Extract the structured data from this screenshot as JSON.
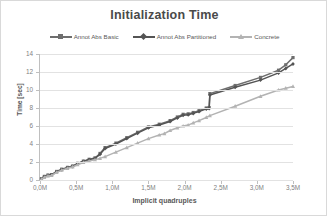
{
  "chart_data": {
    "type": "line",
    "title": "Initialization Time",
    "xlabel": "Implicit quadruples",
    "ylabel": "Time [sec]",
    "xlim": [
      0,
      3500000
    ],
    "ylim": [
      0,
      14
    ],
    "grid": true,
    "legend_position": "top",
    "x_tick_labels": [
      "0,0M",
      "0,5M",
      "1,0M",
      "1,5M",
      "2,0M",
      "2,5M",
      "3,0M",
      "3,5M"
    ],
    "x_tick_values": [
      0,
      500000,
      1000000,
      1500000,
      2000000,
      2500000,
      3000000,
      3500000
    ],
    "y_tick_labels": [
      "0",
      "2",
      "4",
      "6",
      "8",
      "10",
      "12",
      "14"
    ],
    "y_tick_values": [
      0,
      2,
      4,
      6,
      8,
      10,
      12,
      14
    ],
    "series": [
      {
        "name": "Annot Abs Basic",
        "color": "#6e6e6e",
        "marker": "square",
        "x": [
          20000,
          60000,
          110000,
          160000,
          230000,
          300000,
          380000,
          450000,
          520000,
          600000,
          680000,
          760000,
          830000,
          900000,
          1050000,
          1200000,
          1350000,
          1500000,
          1650000,
          1800000,
          1900000,
          1980000,
          2050000,
          2120000,
          2200000,
          2300000,
          2340000,
          2350000,
          2700000,
          3050000,
          3300000,
          3400000,
          3500000
        ],
        "y": [
          0.15,
          0.4,
          0.55,
          0.6,
          0.95,
          1.2,
          1.4,
          1.55,
          1.85,
          2.1,
          2.3,
          2.45,
          2.95,
          3.6,
          4.1,
          4.7,
          5.3,
          5.9,
          6.2,
          6.6,
          7.0,
          7.3,
          7.35,
          7.5,
          7.7,
          8.0,
          8.05,
          9.6,
          10.5,
          11.4,
          12.2,
          12.8,
          13.6
        ]
      },
      {
        "name": "Annot Abs Partitioned",
        "color": "#545454",
        "marker": "diamond",
        "x": [
          20000,
          60000,
          110000,
          160000,
          230000,
          300000,
          380000,
          450000,
          520000,
          600000,
          680000,
          760000,
          830000,
          900000,
          1050000,
          1200000,
          1350000,
          1500000,
          1650000,
          1800000,
          1900000,
          1980000,
          2050000,
          2120000,
          2200000,
          2300000,
          2340000,
          2350000,
          2700000,
          3050000,
          3300000,
          3400000,
          3500000
        ],
        "y": [
          0.1,
          0.35,
          0.5,
          0.55,
          0.9,
          1.15,
          1.35,
          1.5,
          1.8,
          2.05,
          2.25,
          2.4,
          2.85,
          3.5,
          4.0,
          4.6,
          5.2,
          5.8,
          6.1,
          6.5,
          6.9,
          7.2,
          7.25,
          7.4,
          7.6,
          7.9,
          7.95,
          9.45,
          10.3,
          11.1,
          11.9,
          12.4,
          12.9
        ]
      },
      {
        "name": "Concrete",
        "color": "#b3b3b3",
        "marker": "triangle",
        "x": [
          20000,
          60000,
          110000,
          160000,
          230000,
          300000,
          380000,
          450000,
          520000,
          600000,
          680000,
          760000,
          830000,
          900000,
          1050000,
          1200000,
          1350000,
          1500000,
          1650000,
          1720000,
          1800000,
          1900000,
          1980000,
          2050000,
          2120000,
          2200000,
          2300000,
          2350000,
          2700000,
          3050000,
          3300000,
          3400000,
          3500000
        ],
        "y": [
          0.1,
          0.3,
          0.45,
          0.5,
          0.85,
          1.1,
          1.3,
          1.45,
          1.7,
          1.95,
          2.1,
          2.25,
          2.4,
          2.6,
          3.1,
          3.6,
          4.1,
          4.6,
          5.0,
          5.15,
          5.5,
          5.8,
          6.0,
          6.1,
          6.35,
          6.6,
          6.95,
          7.15,
          8.2,
          9.3,
          10.0,
          10.2,
          10.4
        ]
      }
    ]
  },
  "legend": {
    "items": [
      {
        "label": "Annot Abs Basic",
        "color": "#6e6e6e",
        "marker": "square"
      },
      {
        "label": "Annot Abs Partitioned",
        "color": "#545454",
        "marker": "diamond"
      },
      {
        "label": "Concrete",
        "color": "#b3b3b3",
        "marker": "triangle"
      }
    ]
  },
  "colors": {
    "grid": "#e2e2e2",
    "axis": "#bfbfbf",
    "tick_text": "#7f7f7f",
    "title_text": "#4a4a4a",
    "frame_border": "#d9d9d9"
  }
}
